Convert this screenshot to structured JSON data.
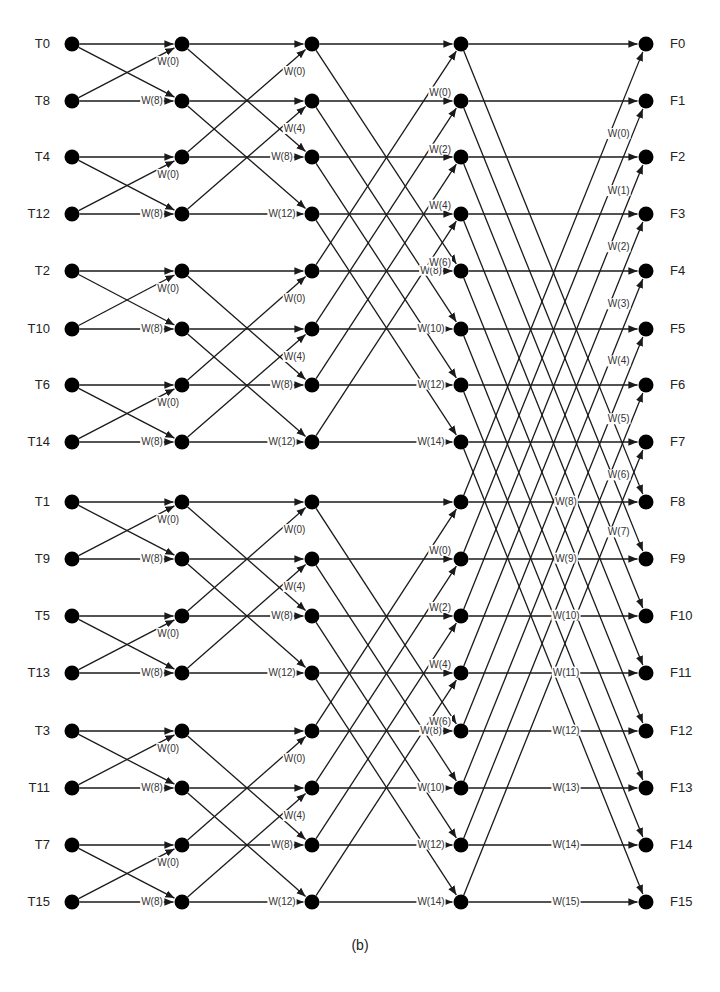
{
  "diagram": {
    "caption": "(b)",
    "inputs": [
      "T0",
      "T8",
      "T4",
      "T12",
      "T2",
      "T10",
      "T6",
      "T14",
      "T1",
      "T9",
      "T5",
      "T13",
      "T3",
      "T11",
      "T7",
      "T15"
    ],
    "outputs": [
      "F0",
      "F1",
      "F2",
      "F3",
      "F4",
      "F5",
      "F6",
      "F7",
      "F8",
      "F9",
      "F10",
      "F11",
      "F12",
      "F13",
      "F14",
      "F15"
    ],
    "columns_x": [
      72,
      182,
      312,
      461,
      646
    ],
    "rows_y": [
      44,
      101,
      157,
      214,
      271,
      329,
      385,
      442,
      502,
      559,
      616,
      673,
      731,
      788,
      845,
      902
    ],
    "stages": [
      {
        "stage": 1,
        "span": 1,
        "cross_twiddles": [
          "W(0)",
          "W(0)",
          "W(0)",
          "W(0)",
          "W(0)",
          "W(0)",
          "W(0)",
          "W(0)"
        ],
        "straight_twiddles": [
          "W(8)",
          "W(8)",
          "W(8)",
          "W(8)",
          "W(8)",
          "W(8)",
          "W(8)",
          "W(8)"
        ]
      },
      {
        "stage": 2,
        "span": 2,
        "cross_twiddles": [
          "W(0)",
          "W(4)",
          "W(0)",
          "W(4)",
          "W(0)",
          "W(4)",
          "W(0)",
          "W(4)"
        ],
        "straight_twiddles": [
          "W(8)",
          "W(12)",
          "W(8)",
          "W(12)",
          "W(8)",
          "W(12)",
          "W(8)",
          "W(12)"
        ]
      },
      {
        "stage": 3,
        "span": 4,
        "cross_twiddles": [
          "W(0)",
          "W(2)",
          "W(4)",
          "W(6)",
          "W(0)",
          "W(2)",
          "W(4)",
          "W(6)"
        ],
        "straight_twiddles": [
          "W(8)",
          "W(10)",
          "W(12)",
          "W(14)",
          "W(8)",
          "W(10)",
          "W(12)",
          "W(14)"
        ]
      },
      {
        "stage": 4,
        "span": 8,
        "cross_twiddles": [
          "W(0)",
          "W(1)",
          "W(2)",
          "W(3)",
          "W(4)",
          "W(5)",
          "W(6)",
          "W(7)"
        ],
        "straight_twiddles": [
          "W(8)",
          "W(9)",
          "W(10)",
          "W(11)",
          "W(12)",
          "W(13)",
          "W(14)",
          "W(15)"
        ]
      }
    ],
    "colors": {
      "node": "#000000",
      "edge": "#1a1a1a",
      "text": "#222222"
    }
  }
}
